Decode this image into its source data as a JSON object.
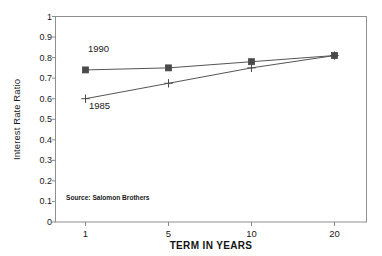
{
  "chart_data": {
    "type": "line",
    "title": "",
    "subtitle": "",
    "xlabel": "TERM IN YEARS",
    "ylabel": "Interest Rate Ratio",
    "categories": [
      "1",
      "5",
      "10",
      "20"
    ],
    "x_tick_labels": [
      "1",
      "5",
      "10",
      "20"
    ],
    "x_scale": "categorical",
    "y_tick_labels": [
      "0",
      "0.1",
      "0.2",
      "0.3",
      "0.4",
      "0.5",
      "0.6",
      "0.7",
      "0.8",
      "0.9",
      "1"
    ],
    "y_tick_values": [
      0,
      0.1,
      0.2,
      0.3,
      0.4,
      0.5,
      0.6,
      0.7,
      0.8,
      0.9,
      1
    ],
    "ylim": [
      0,
      1
    ],
    "grid": false,
    "legend": "inline-annotations",
    "series": [
      {
        "name": "1990",
        "marker": "filled-square",
        "color": "#555555",
        "values": [
          0.74,
          0.75,
          0.78,
          0.81
        ]
      },
      {
        "name": "1985",
        "marker": "plus",
        "color": "#555555",
        "values": [
          0.6,
          0.675,
          0.75,
          0.81
        ]
      }
    ],
    "annotations": [
      {
        "text": "1990",
        "series": "1990"
      },
      {
        "text": "1985",
        "series": "1985"
      },
      {
        "text": "Source: Salomon Brothers",
        "role": "source-note"
      }
    ]
  },
  "labels": {
    "source_note": "Source: Salomon Brothers",
    "annot_1990": "1990",
    "annot_1985": "1985"
  },
  "colors": {
    "axis": "#8a8a8a",
    "line": "#6e6e6e",
    "marker": "#4a4a4a",
    "text": "#1a1a1a",
    "background": "#ffffff"
  }
}
